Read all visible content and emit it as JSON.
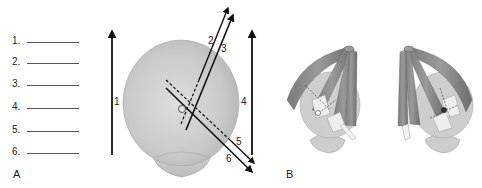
{
  "answer_blanks": [
    {
      "number": "1."
    },
    {
      "number": "2."
    },
    {
      "number": "3."
    },
    {
      "number": "4."
    },
    {
      "number": "5."
    },
    {
      "number": "6."
    }
  ],
  "panels": {
    "a_label": "A",
    "b_label": "B"
  },
  "panel_a": {
    "axis_labels": [
      "1",
      "2",
      "3",
      "4",
      "5",
      "6"
    ],
    "description": "Schematic right eye globe with muscle action axes"
  },
  "panel_b": {
    "description": "Two eyes with extraocular muscles (superior view)"
  },
  "colors": {
    "globe": "#c8c8c8",
    "muscle": "#8a8a8a",
    "arrows": "#111111"
  }
}
